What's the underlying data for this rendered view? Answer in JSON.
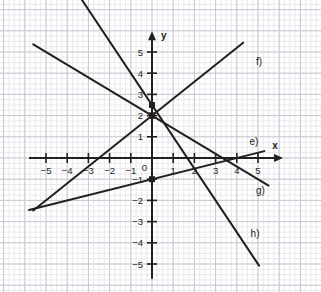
{
  "figure": {
    "kind": "coordinate-grid-line-plot",
    "background_color": "#ffffff",
    "grid": {
      "minor_color": "#e9e9ee",
      "major_color": "#c9c9d2",
      "minor_step_units": 0.25,
      "major_step_units": 1,
      "grid_on": true
    },
    "axis_color": "#231f20",
    "line_color": "#231f20",
    "origin_px": {
      "x": 152,
      "y": 158
    },
    "unit_px": 21.2
  },
  "axes": {
    "x_name": "x",
    "y_name": "y",
    "origin_label": "0",
    "x_range": [
      -5.8,
      5.9
    ],
    "y_range": [
      -5.7,
      5.7
    ],
    "x_ticks": [
      {
        "value": -5,
        "label": "−5"
      },
      {
        "value": -4,
        "label": "−4"
      },
      {
        "value": -3,
        "label": "−3"
      },
      {
        "value": -2,
        "label": "−2"
      },
      {
        "value": -1,
        "label": "−1"
      },
      {
        "value": 1,
        "label": "1"
      },
      {
        "value": 2,
        "label": "2"
      },
      {
        "value": 3,
        "label": "3"
      },
      {
        "value": 4,
        "label": "4"
      },
      {
        "value": 5,
        "label": "5"
      }
    ],
    "y_ticks": [
      {
        "value": 5,
        "label": "5"
      },
      {
        "value": 4,
        "label": "4"
      },
      {
        "value": 3,
        "label": "3"
      },
      {
        "value": 2,
        "label": "2"
      },
      {
        "value": 1,
        "label": "1"
      },
      {
        "value": -1,
        "label": "−1"
      },
      {
        "value": -2,
        "label": "−2"
      },
      {
        "value": -3,
        "label": "−3"
      },
      {
        "value": -4,
        "label": "−4"
      },
      {
        "value": -5,
        "label": "−5"
      }
    ]
  },
  "chart_data": {
    "type": "line",
    "title": "",
    "xlabel": "x",
    "ylabel": "y",
    "xlim": [
      -5.8,
      5.9
    ],
    "ylim": [
      -5.7,
      5.7
    ],
    "grid": true,
    "legend_position": "inline-end-of-line",
    "series": [
      {
        "name": "e)",
        "label": "e)",
        "slope": 0.25,
        "intercept": -1,
        "x_start": -5.8,
        "x_end": 5.3,
        "label_x": 4.6,
        "label_y": 0.75,
        "marker_points": [
          {
            "x": 0,
            "y": -1
          }
        ]
      },
      {
        "name": "f)",
        "label": "f)",
        "slope": 0.8,
        "intercept": 2,
        "x_start": -5.6,
        "x_end": 4.3,
        "label_x": 4.9,
        "label_y": 4.55,
        "marker_points": [
          {
            "x": 0,
            "y": 2
          }
        ]
      },
      {
        "name": "g)",
        "label": "g)",
        "slope": -0.6,
        "intercept": 2,
        "x_start": -5.6,
        "x_end": 5.5,
        "label_x": 4.9,
        "label_y": -1.55,
        "marker_points": [
          {
            "x": 0,
            "y": 2
          }
        ]
      },
      {
        "name": "h)",
        "label": "h)",
        "slope": -1.5,
        "intercept": 2.5,
        "x_start": -4.0,
        "x_end": 5.05,
        "label_x": 4.65,
        "label_y": -3.6,
        "marker_points": [
          {
            "x": 0,
            "y": 2.5
          }
        ]
      }
    ]
  }
}
